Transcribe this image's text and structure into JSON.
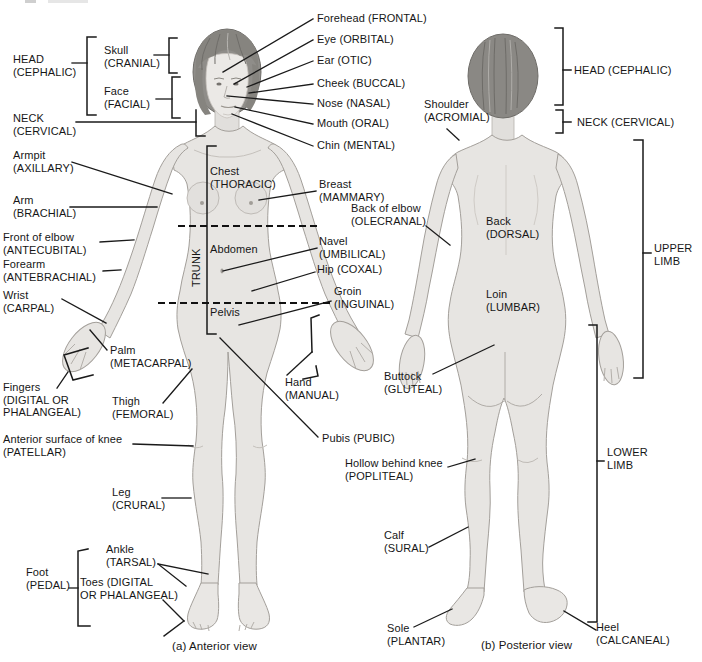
{
  "captions": {
    "a": "(a) Anterior view",
    "b": "(b) Posterior view"
  },
  "labels": {
    "head_left": "HEAD\n(CEPHALIC)",
    "skull": "Skull\n(CRANIAL)",
    "face": "Face\n(FACIAL)",
    "neck_left": "NECK\n(CERVICAL)",
    "armpit": "Armpit\n(AXILLARY)",
    "arm": "Arm\n(BRACHIAL)",
    "front_of_elbow": "Front of elbow\n(ANTECUBITAL)",
    "forearm": "Forearm\n(ANTEBRACHIAL)",
    "wrist": "Wrist\n(CARPAL)",
    "palm": "Palm\n(METACARPAL)",
    "fingers": "Fingers\n(DIGITAL OR\nPHALANGEAL)",
    "thigh": "Thigh\n(FEMORAL)",
    "knee": "Anterior surface of knee\n(PATELLAR)",
    "leg": "Leg\n(CRURAL)",
    "ankle": "Ankle\n(TARSAL)",
    "foot": "Foot\n(PEDAL)",
    "toes": "Toes (DIGITAL\nOR PHALANGEAL)",
    "forehead": "Forehead (FRONTAL)",
    "eye": "Eye (ORBITAL)",
    "ear": "Ear (OTIC)",
    "cheek": "Cheek (BUCCAL)",
    "nose": "Nose (NASAL)",
    "mouth": "Mouth (ORAL)",
    "chin": "Chin (MENTAL)",
    "chest": "Chest\n(THORACIC)",
    "trunk": "TRUNK",
    "abdomen": "Abdomen",
    "pelvis": "Pelvis",
    "breast": "Breast\n(MAMMARY)",
    "back_of_elbow": "Back of elbow\n(OLECRANAL)",
    "navel": "Navel\n(UMBILICAL)",
    "hip": "Hip (COXAL)",
    "groin": "Groin\n(INGUINAL)",
    "hand": "Hand\n(MANUAL)",
    "pubis": "Pubis (PUBIC)",
    "shoulder": "Shoulder\n(ACROMIAL)",
    "back": "Back\n(DORSAL)",
    "loin": "Loin\n(LUMBAR)",
    "buttock": "Buttock\n(GLUTEAL)",
    "hollow_behind_knee": "Hollow behind knee\n(POPLITEAL)",
    "calf": "Calf\n(SURAL)",
    "sole": "Sole\n(PLANTAR)",
    "heel": "Heel\n(CALCANEAL)",
    "head_right": "HEAD (CEPHALIC)",
    "neck_right": "NECK (CERVICAL)",
    "upper_limb": "UPPER\nLIMB",
    "lower_limb": "LOWER\nLIMB"
  },
  "colors": {
    "body": "#e7e5e2",
    "body_shadow": "#c7c3be",
    "hair": "#8f8d89",
    "leader_line": "#1a1a1a",
    "text": "#161616",
    "background": "#ffffff"
  }
}
